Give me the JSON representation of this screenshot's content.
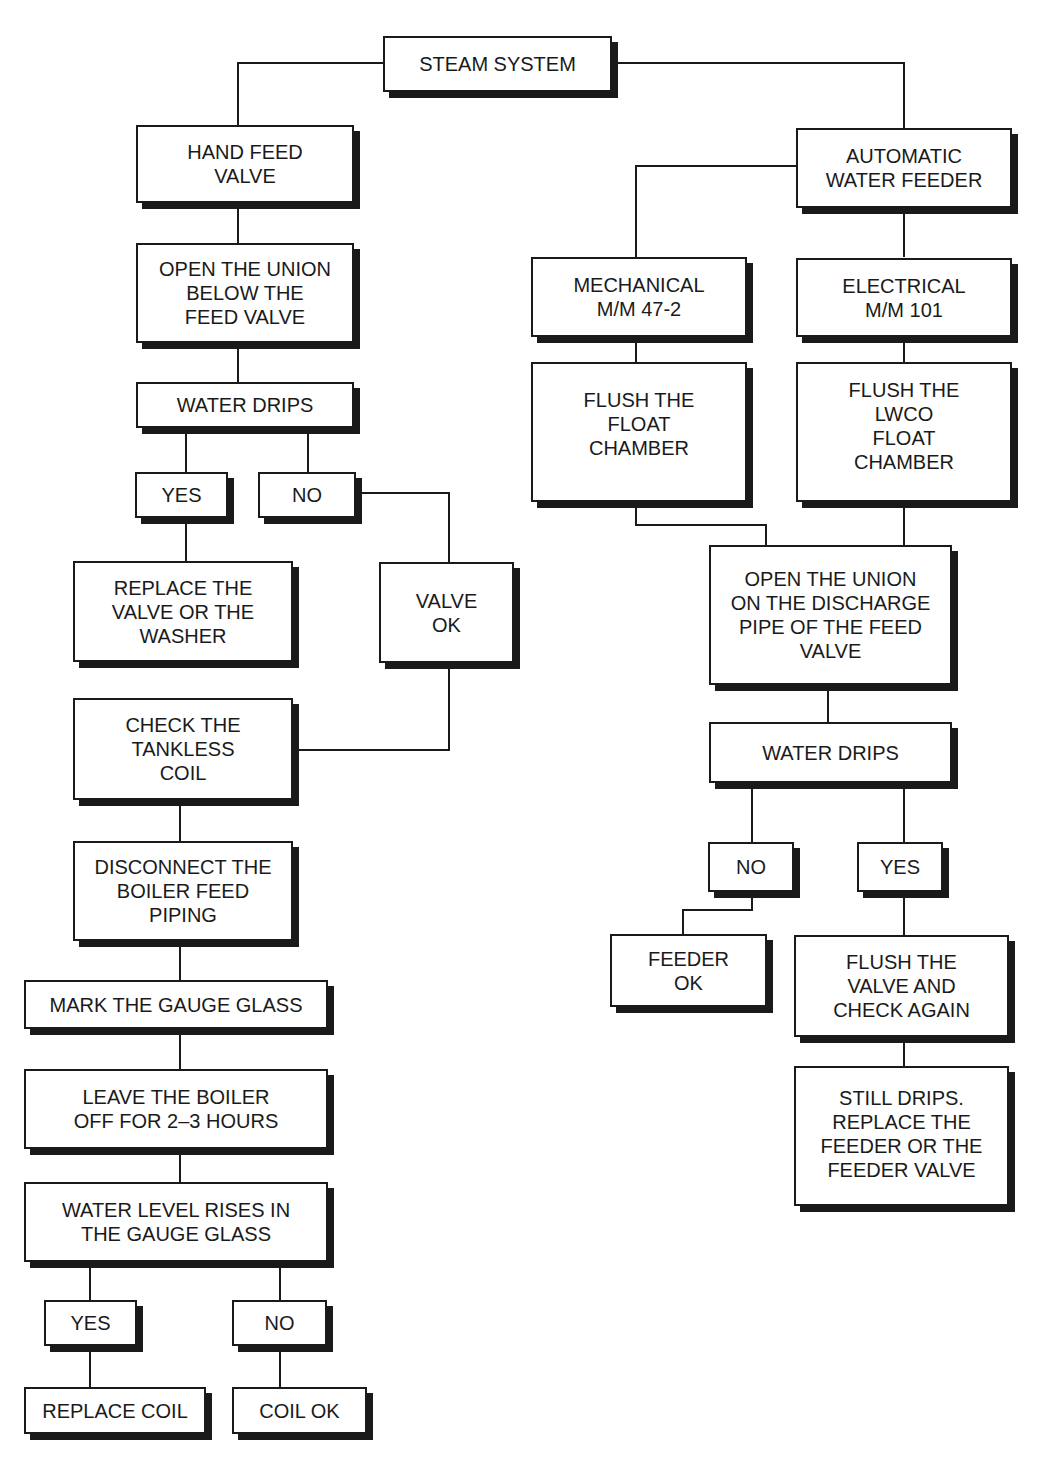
{
  "flowchart": {
    "root": {
      "label": "STEAM SYSTEM"
    },
    "hand_feed": {
      "title": "HAND FEED\nVALVE",
      "open_union": "OPEN THE UNION\nBELOW THE\nFEED VALVE",
      "water_drips": "WATER DRIPS",
      "yes": "YES",
      "no": "NO",
      "replace_valve": "REPLACE THE\nVALVE OR THE\nWASHER",
      "valve_ok": "VALVE\nOK",
      "check_coil": "CHECK THE\nTANKLESS\nCOIL",
      "disconnect": "DISCONNECT THE\nBOILER FEED\nPIPING",
      "mark_glass": "MARK THE GAUGE GLASS",
      "leave_off": "LEAVE THE BOILER\nOFF FOR 2–3 HOURS",
      "level_rises": "WATER LEVEL RISES IN\nTHE GAUGE GLASS",
      "yes2": "YES",
      "no2": "NO",
      "replace_coil": "REPLACE COIL",
      "coil_ok": "COIL OK"
    },
    "auto_feeder": {
      "title": "AUTOMATIC\nWATER FEEDER",
      "mechanical": "MECHANICAL\nM/M 47-2",
      "electrical": "ELECTRICAL\nM/M 101",
      "flush_float": "FLUSH THE\nFLOAT\nCHAMBER",
      "flush_lwco": "FLUSH THE\nLWCO\nFLOAT\nCHAMBER",
      "open_discharge": "OPEN THE UNION\nON THE DISCHARGE\nPIPE OF THE FEED\nVALVE",
      "water_drips": "WATER DRIPS",
      "no": "NO",
      "yes": "YES",
      "feeder_ok": "FEEDER\nOK",
      "flush_valve": "FLUSH THE\nVALVE AND\nCHECK AGAIN",
      "still_drips": "STILL DRIPS.\nREPLACE THE\nFEEDER OR THE\nFEEDER VALVE"
    }
  }
}
